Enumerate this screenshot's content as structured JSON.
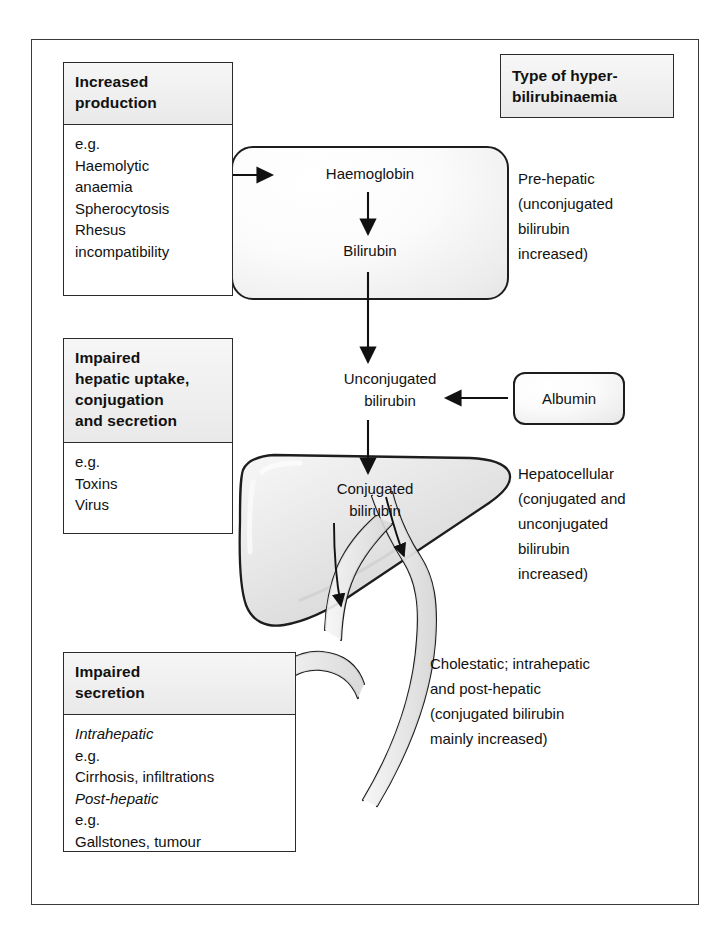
{
  "diagram": {
    "left_panels": [
      {
        "name": "increased-production",
        "header": "Increased\nproduction",
        "body": "e.g.\nHaemolytic\nanaemia\nSpherocytosis\nRhesus\nincompatibility"
      },
      {
        "name": "impaired-hepatic-uptake",
        "header": "Impaired\nhepatic uptake,\nconjugation\nand secretion",
        "body": "e.g.\nToxins\nVirus"
      },
      {
        "name": "impaired-secretion",
        "header": "Impaired\nsecretion",
        "body_lines": [
          {
            "text": "Intrahepatic",
            "italic": true
          },
          {
            "text": "e.g.",
            "italic": false
          },
          {
            "text": "Cirrhosis, infiltrations",
            "italic": false
          },
          {
            "text": "Post-hepatic",
            "italic": true
          },
          {
            "text": "e.g.",
            "italic": false
          },
          {
            "text": "Gallstones, tumour",
            "italic": false
          }
        ]
      }
    ],
    "type_header": "Type of hyper-\nbilirubinaemia",
    "type_annotations": [
      {
        "name": "pre-hepatic",
        "text": "Pre-hepatic\n(unconjugated\nbilirubin\nincreased)"
      },
      {
        "name": "hepatocellular",
        "text": "Hepatocellular\n(conjugated and\nunconjugated\nbilirubin\nincreased)"
      },
      {
        "name": "cholestatic",
        "text": "Cholestatic; intrahepatic\nand post-hepatic\n(conjugated bilirubin\nmainly increased)"
      }
    ],
    "flow": {
      "haemoglobin": "Haemoglobin",
      "bilirubin": "Bilirubin",
      "unconjugated_bilirubin": "Unconjugated\nbilirubin",
      "conjugated_bilirubin": "Conjugated\nbilirubin",
      "albumin": "Albumin"
    },
    "anatomy": {
      "liver": "liver-shape",
      "gallbladder": "gallbladder-shape",
      "bile_duct": "bile-duct-shape"
    },
    "colors": {
      "frame_border": "#3a3a3a",
      "box_border": "#2b2b2b",
      "shape_outline": "#1d1d1d",
      "panel_header_fill": "#efefef",
      "organ_fill": "#e4e4e4",
      "page_background": "#ffffff",
      "text": "#111111"
    }
  }
}
